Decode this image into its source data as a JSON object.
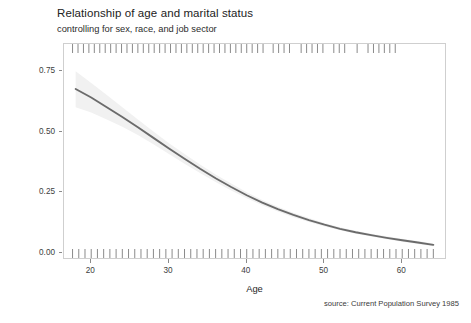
{
  "chart": {
    "title": "Relationship of age and marital status",
    "subtitle": "controlling for sex, race, and job sector",
    "caption": "source: Current Population Survey 1985"
  },
  "chart_data": {
    "type": "line",
    "title": "Relationship of age and marital status",
    "subtitle": "controlling for sex, race, and job sector",
    "caption": "source: Current Population Survey 1985",
    "xlabel": "Age",
    "ylabel": "Prob(Married)",
    "xlim": [
      16.5,
      65.5
    ],
    "ylim": [
      -0.02,
      0.86
    ],
    "xticks": [
      20,
      30,
      40,
      50,
      60
    ],
    "xtick_labels": [
      "20",
      "30",
      "40",
      "50",
      "60"
    ],
    "yticks": [
      0.0,
      0.25,
      0.5,
      0.75
    ],
    "ytick_labels": [
      "0.00",
      "0.25",
      "0.50",
      "0.75"
    ],
    "grid": false,
    "legend": "none",
    "line_color": "#6b6b6b",
    "ribbon_color": "#f1f1f1",
    "series": [
      {
        "name": "Prob(Married)",
        "x": [
          18,
          20,
          22,
          24,
          26,
          28,
          30,
          32,
          34,
          36,
          38,
          40,
          42,
          44,
          46,
          48,
          50,
          52,
          54,
          56,
          58,
          60,
          62,
          64
        ],
        "values": [
          0.675,
          0.64,
          0.6,
          0.56,
          0.518,
          0.474,
          0.43,
          0.388,
          0.347,
          0.308,
          0.272,
          0.238,
          0.208,
          0.181,
          0.157,
          0.136,
          0.117,
          0.1,
          0.086,
          0.074,
          0.063,
          0.053,
          0.044,
          0.034
        ],
        "ci_low": [
          0.6,
          0.578,
          0.55,
          0.52,
          0.486,
          0.448,
          0.408,
          0.368,
          0.33,
          0.293,
          0.258,
          0.226,
          0.197,
          0.171,
          0.148,
          0.128,
          0.11,
          0.094,
          0.08,
          0.068,
          0.057,
          0.047,
          0.038,
          0.028
        ],
        "ci_high": [
          0.748,
          0.7,
          0.65,
          0.6,
          0.55,
          0.5,
          0.452,
          0.408,
          0.364,
          0.323,
          0.286,
          0.25,
          0.219,
          0.191,
          0.166,
          0.144,
          0.124,
          0.106,
          0.092,
          0.08,
          0.069,
          0.059,
          0.05,
          0.04
        ]
      }
    ],
    "rug_top_x": [
      17.6,
      18.3,
      19.0,
      19.7,
      20.4,
      21.1,
      21.8,
      22.5,
      23.2,
      23.9,
      24.6,
      25.3,
      26.0,
      26.7,
      27.4,
      28.1,
      28.8,
      29.5,
      30.2,
      30.9,
      31.6,
      32.3,
      33.0,
      33.7,
      34.4,
      35.1,
      35.8,
      36.5,
      37.2,
      37.9,
      38.6,
      39.3,
      40.0,
      40.7,
      41.4,
      42.1,
      43.4,
      44.1,
      44.8,
      45.5,
      47.0,
      47.7,
      48.4,
      49.1,
      49.8,
      51.2,
      51.9,
      52.6,
      54.2,
      55.6,
      56.3,
      57.0,
      57.7,
      58.4,
      59.1
    ],
    "rug_bottom_x": [
      17.6,
      18.4,
      19.2,
      20.0,
      20.8,
      21.6,
      22.4,
      23.2,
      24.0,
      24.8,
      25.6,
      26.4,
      27.2,
      28.0,
      28.8,
      29.6,
      30.4,
      31.2,
      32.0,
      32.8,
      33.6,
      34.4,
      35.2,
      36.0,
      36.8,
      37.6,
      38.4,
      39.2,
      40.0,
      40.8,
      41.6,
      42.4,
      43.2,
      44.0,
      44.8,
      45.6,
      46.4,
      47.2,
      48.0,
      48.8,
      49.6,
      50.4,
      51.2,
      52.0,
      52.8,
      53.6,
      54.4,
      55.2,
      56.0,
      56.8,
      57.6,
      58.4,
      59.2,
      60.0,
      60.8,
      61.6,
      62.4,
      63.2,
      64.0
    ]
  }
}
